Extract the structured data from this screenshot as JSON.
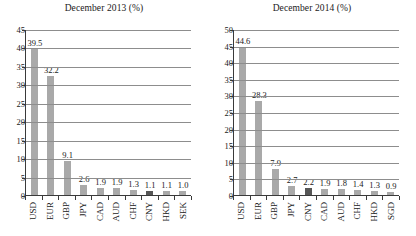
{
  "chart_data": [
    {
      "type": "bar",
      "title": "December 2013 (%)",
      "xlabel": "",
      "ylabel": "",
      "ylim": [
        0,
        45
      ],
      "ystep": 5,
      "yticks": [
        45,
        40,
        35,
        30,
        25,
        20,
        15,
        10,
        5,
        0
      ],
      "grid": true,
      "legend": "none",
      "categories": [
        "USD",
        "EUR",
        "GBP",
        "JPY",
        "CAD",
        "AUD",
        "CHF",
        "CNY",
        "HKD",
        "SEK"
      ],
      "values": [
        39.5,
        32.2,
        9.1,
        2.6,
        1.9,
        1.9,
        1.3,
        1.1,
        1.1,
        1.0
      ],
      "labels": [
        "39.5",
        "32.2",
        "9.1",
        "2.6",
        "1.9",
        "1.9",
        "1.3",
        "1.1",
        "1.1",
        "1.0"
      ],
      "highlight_category": "CNY",
      "colors": {
        "bar": "#a9a9a9",
        "highlight": "#565656",
        "grid": "#8d8d8d",
        "axis": "#3a3a3a",
        "text": "#1a1a1a"
      }
    },
    {
      "type": "bar",
      "title": "December 2014 (%)",
      "xlabel": "",
      "ylabel": "",
      "ylim": [
        0,
        50
      ],
      "ystep": 5,
      "yticks": [
        50,
        45,
        40,
        35,
        30,
        25,
        20,
        15,
        10,
        5,
        0
      ],
      "grid": true,
      "legend": "none",
      "categories": [
        "USD",
        "EUR",
        "GBP",
        "JPY",
        "CNY",
        "CAD",
        "AUD",
        "CHF",
        "HKD",
        "SGD"
      ],
      "values": [
        44.6,
        28.3,
        7.9,
        2.7,
        2.2,
        1.9,
        1.8,
        1.4,
        1.3,
        0.9
      ],
      "labels": [
        "44.6",
        "28.3",
        "7.9",
        "2.7",
        "2.2",
        "1.9",
        "1.8",
        "1.4",
        "1.3",
        "0.9"
      ],
      "highlight_category": "CNY",
      "colors": {
        "bar": "#a9a9a9",
        "highlight": "#565656",
        "grid": "#8d8d8d",
        "axis": "#3a3a3a",
        "text": "#1a1a1a"
      }
    }
  ]
}
